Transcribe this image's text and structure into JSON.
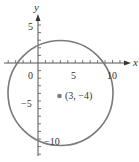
{
  "chart_data": {
    "type": "scatter",
    "title": "",
    "xlabel": "x",
    "ylabel": "y",
    "xlim": [
      -5,
      12
    ],
    "ylim": [
      -12,
      8
    ],
    "grid": false,
    "x_ticks": [
      0,
      5,
      10
    ],
    "y_ticks": [
      5,
      -5,
      -10
    ],
    "x_tick_labels": [
      "0",
      "5",
      "10"
    ],
    "y_tick_labels": [
      "5",
      "−5",
      "−10"
    ],
    "circle": {
      "center": [
        3,
        -4
      ],
      "radius": 7
    },
    "points": [
      {
        "x": 3,
        "y": -4,
        "label": "(3, −4)"
      }
    ],
    "colors": {
      "circle": "#777777",
      "axis": "#555555",
      "point": "#777777",
      "text": "#333333"
    }
  },
  "labels": {
    "x_axis": "x",
    "y_axis": "y",
    "tick_x_0": "0",
    "tick_x_5": "5",
    "tick_x_10": "10",
    "tick_y_5": "5",
    "tick_y_neg5": "−5",
    "tick_y_neg10": "−10",
    "center_point": "(3, −4)"
  }
}
